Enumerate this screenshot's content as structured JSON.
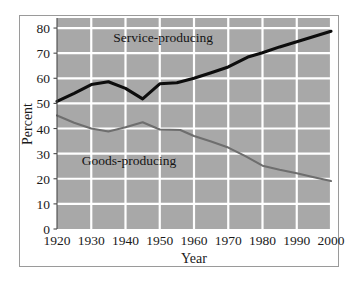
{
  "chart_data": {
    "type": "line",
    "title": "",
    "xlabel": "Year",
    "ylabel": "Percent",
    "xlim": [
      1920,
      2000
    ],
    "ylim": [
      0,
      84
    ],
    "grid": true,
    "legend_position": "inline-annotation",
    "plot_background": "#a8a8a8",
    "gridline_color": "#ffffff",
    "frame_color": "#9a9a9a",
    "xticks": [
      "1920",
      "1930",
      "1940",
      "1950",
      "1960",
      "1970",
      "1980",
      "1990",
      "2000"
    ],
    "xtick_values": [
      1920,
      1930,
      1940,
      1950,
      1960,
      1970,
      1980,
      1990,
      2000
    ],
    "yticks": [
      "0",
      "10",
      "20",
      "30",
      "40",
      "50",
      "60",
      "70",
      "80"
    ],
    "ytick_values": [
      0,
      10,
      20,
      30,
      40,
      50,
      60,
      70,
      80
    ],
    "series": [
      {
        "name": "Service-producing",
        "color": "#0d0d0d",
        "width": 3.1,
        "label_x": 1951,
        "label_y": 74.5,
        "x": [
          1920,
          1925,
          1930,
          1935,
          1940,
          1945,
          1950,
          1955,
          1960,
          1965,
          1970,
          1976,
          1980,
          1985,
          1990,
          1995,
          2000
        ],
        "values": [
          50.8,
          54.0,
          57.5,
          58.6,
          56.0,
          51.8,
          57.8,
          58.2,
          60.0,
          62.2,
          64.5,
          68.6,
          70.2,
          72.5,
          74.5,
          76.6,
          78.7
        ]
      },
      {
        "name": "Goods-producing",
        "color": "#6e6e6e",
        "width": 2.1,
        "label_x": 1941,
        "label_y": 25.5,
        "x": [
          1920,
          1925,
          1930,
          1935,
          1940,
          1945,
          1950,
          1956,
          1960,
          1965,
          1970,
          1975,
          1980,
          1985,
          1990,
          1995,
          2000
        ],
        "values": [
          45.2,
          42.3,
          40.0,
          38.8,
          40.5,
          42.5,
          39.6,
          39.4,
          37.0,
          34.8,
          32.4,
          29.0,
          25.2,
          23.6,
          22.2,
          20.6,
          19.1
        ]
      }
    ]
  }
}
